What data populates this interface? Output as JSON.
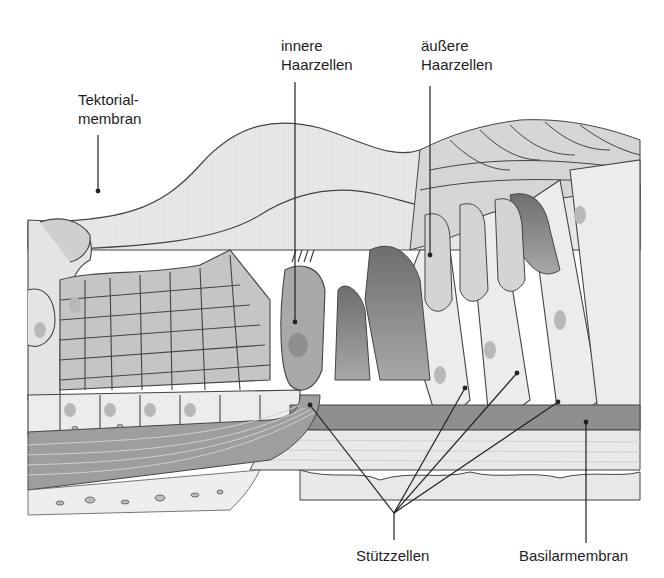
{
  "figure": {
    "colors": {
      "background": "#ffffff",
      "tissue_light": "#e6e6e6",
      "tissue_mid": "#c9c9c9",
      "tissue_dark": "#9a9a9a",
      "tissue_darker": "#7a7a7a",
      "outline": "#3a3a3a",
      "nucleus": "#b5b5b5",
      "label_text": "#1e1e1e"
    }
  },
  "labels": {
    "tektorialmembran": {
      "line1": "Tektorial-",
      "line2": "membran"
    },
    "innere_haarzellen": {
      "line1": "innere",
      "line2": "Haarzellen"
    },
    "aeussere_haarzellen": {
      "line1": "äußere",
      "line2": "Haarzellen"
    },
    "stuetzzellen": {
      "text": "Stützzellen"
    },
    "basilarmembran": {
      "text": "Basilarmembran"
    }
  }
}
